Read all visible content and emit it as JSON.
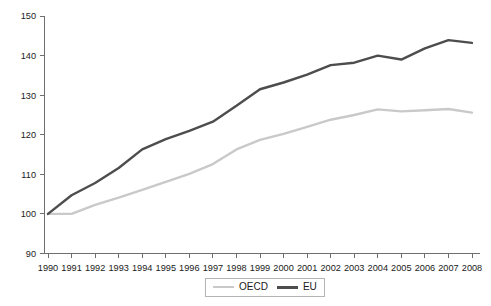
{
  "chart_data": {
    "type": "line",
    "title": "",
    "subtitle": "",
    "xlabel": "",
    "ylabel": "",
    "grid": false,
    "legend_position": "bottom-center",
    "xlim": [
      1990,
      2008
    ],
    "ylim": [
      90,
      150
    ],
    "ytick_step": 10,
    "ytick_labels": [
      "150",
      "140",
      "130",
      "120",
      "110",
      "100",
      "90"
    ],
    "ytick_values": [
      150,
      140,
      130,
      120,
      110,
      100,
      90
    ],
    "categories": [
      "1990",
      "1991",
      "1992",
      "1993",
      "1994",
      "1995",
      "1996",
      "1997",
      "1998",
      "1999",
      "2000",
      "2001",
      "2002",
      "2003",
      "2004",
      "2005",
      "2006",
      "2007",
      "2008"
    ],
    "x": [
      1990,
      1991,
      1992,
      1993,
      1994,
      1995,
      1996,
      1997,
      1998,
      1999,
      2000,
      2001,
      2002,
      2003,
      2004,
      2005,
      2006,
      2007,
      2008
    ],
    "series": [
      {
        "name": "OECD",
        "color": "#c9c9c9",
        "line_width": 2.4,
        "values": [
          100,
          100,
          102.3,
          104.1,
          106.1,
          108.1,
          110.1,
          112.6,
          116.3,
          118.7,
          120.2,
          122.0,
          123.8,
          125.0,
          126.4,
          125.9,
          126.2,
          126.5,
          125.6
        ]
      },
      {
        "name": "EU",
        "color": "#4d4d4d",
        "line_width": 2.4,
        "values": [
          100,
          104.7,
          107.8,
          111.6,
          116.3,
          118.9,
          121.0,
          123.3,
          127.3,
          131.5,
          133.2,
          135.2,
          137.6,
          138.2,
          140.0,
          139.0,
          141.8,
          143.9,
          143.2
        ]
      }
    ]
  },
  "legend": {
    "items": [
      {
        "label": "OECD",
        "color": "#c9c9c9"
      },
      {
        "label": "EU",
        "color": "#4d4d4d"
      }
    ]
  },
  "axes": {
    "y_axis_color": "#6e6e6e",
    "x_axis_color": "#6e6e6e"
  }
}
